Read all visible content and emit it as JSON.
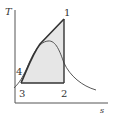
{
  "diagram": {
    "type": "T-s diagram",
    "axes": {
      "y_label": "T",
      "x_label": "s"
    },
    "points": [
      {
        "id": "1",
        "label": "1"
      },
      {
        "id": "2",
        "label": "2"
      },
      {
        "id": "3",
        "label": "3"
      },
      {
        "id": "4",
        "label": "4"
      }
    ],
    "colors": {
      "cycle_fill": "#e6e6e6",
      "line": "#333333",
      "dome": "#444444"
    }
  }
}
